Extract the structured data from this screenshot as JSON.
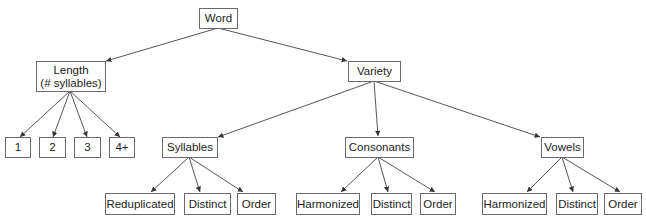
{
  "diagram": {
    "type": "tree",
    "nodes": {
      "root": {
        "label": "Word"
      },
      "length": {
        "label": "Length\n(# syllables)"
      },
      "len1": {
        "label": "1"
      },
      "len2": {
        "label": "2"
      },
      "len3": {
        "label": "3"
      },
      "len4": {
        "label": "4+"
      },
      "variety": {
        "label": "Variety"
      },
      "syllables": {
        "label": "Syllables"
      },
      "consonants": {
        "label": "Consonants"
      },
      "vowels": {
        "label": "Vowels"
      },
      "syl_redup": {
        "label": "Reduplicated"
      },
      "syl_distinct": {
        "label": "Distinct"
      },
      "syl_order": {
        "label": "Order"
      },
      "con_harm": {
        "label": "Harmonized"
      },
      "con_distinct": {
        "label": "Distinct"
      },
      "con_order": {
        "label": "Order"
      },
      "vow_harm": {
        "label": "Harmonized"
      },
      "vow_distinct": {
        "label": "Distinct"
      },
      "vow_order": {
        "label": "Order"
      }
    },
    "edges": [
      [
        "root",
        "length"
      ],
      [
        "root",
        "variety"
      ],
      [
        "length",
        "len1"
      ],
      [
        "length",
        "len2"
      ],
      [
        "length",
        "len3"
      ],
      [
        "length",
        "len4"
      ],
      [
        "variety",
        "syllables"
      ],
      [
        "variety",
        "consonants"
      ],
      [
        "variety",
        "vowels"
      ],
      [
        "syllables",
        "syl_redup"
      ],
      [
        "syllables",
        "syl_distinct"
      ],
      [
        "syllables",
        "syl_order"
      ],
      [
        "consonants",
        "con_harm"
      ],
      [
        "consonants",
        "con_distinct"
      ],
      [
        "consonants",
        "con_order"
      ],
      [
        "vowels",
        "vow_harm"
      ],
      [
        "vowels",
        "vow_distinct"
      ],
      [
        "vowels",
        "vow_order"
      ]
    ],
    "colors": {
      "line": "#444444",
      "border": "#6a6a6a",
      "text": "#222222"
    }
  }
}
